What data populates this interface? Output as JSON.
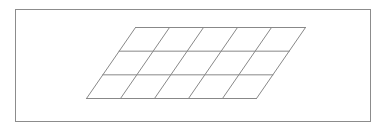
{
  "figure": {
    "type": "geometry-diagram",
    "caption": "",
    "canvas": {
      "width": 388,
      "height": 132,
      "background": "#ffffff"
    },
    "frame": {
      "name": "outer-border-rectangle",
      "x": 15,
      "y": 9,
      "width": 356,
      "height": 113,
      "stroke": "#8c8c8c",
      "stroke_width": 1,
      "fill": "none"
    },
    "parallelogram": {
      "name": "grid-parallelogram",
      "stroke": "#888888",
      "stroke_width": 1,
      "fill": "none",
      "columns": 5,
      "rows": 3,
      "cells_total": 15,
      "vertices": {
        "top_left": {
          "x": 135,
          "y": 27
        },
        "top_right": {
          "x": 305,
          "y": 27
        },
        "bottom_right": {
          "x": 256,
          "y": 98
        },
        "bottom_left": {
          "x": 86,
          "y": 98
        }
      },
      "side_lengths_px": {
        "top": 170,
        "bottom": 170,
        "left": 86.3,
        "right": 86.3
      },
      "skew_offset_px": 49,
      "height_px": 71
    },
    "lines": {
      "row_dividers": 2,
      "column_dividers": 4,
      "row_divider_labels": [
        "row-divider-1",
        "row-divider-2"
      ],
      "column_divider_labels": [
        "column-divider-1",
        "column-divider-2",
        "column-divider-3",
        "column-divider-4"
      ]
    }
  }
}
